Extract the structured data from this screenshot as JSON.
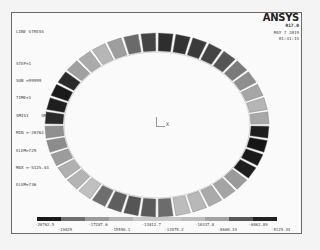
{
  "header": {
    "title": "LINE STRESS",
    "lines": [
      "STEP=1",
      "SUB =99999",
      "TIME=1",
      "SMIS1     SMIS7",
      "MIN =-20762.5",
      "ELEM=729",
      "MAX =-5125.44",
      "ELEM=736"
    ]
  },
  "brand": {
    "logo": "ANSYS",
    "version": "R17.0",
    "date": "MAY  7 2019",
    "time": "01:41:15"
  },
  "triad": {
    "axis_label": "X"
  },
  "legend": {
    "colors": [
      "#1a1a1a",
      "#6e6e6e",
      "#9a9a9a",
      "#b4b4b4",
      "#c8c8c8",
      "#c8c8c8",
      "#bdbdbd",
      "#a2a2a2",
      "#585858",
      "#222222"
    ],
    "labels_top": [
      "-20762.5",
      "-17287.6",
      "-13812.7",
      "-10337.8",
      "-6862.89"
    ],
    "labels_bottom": [
      "-19025",
      "-15550.1",
      "-12075.2",
      "-8600.34",
      "-5125.44"
    ]
  },
  "ring": {
    "center": [
      157,
      125
    ],
    "outer_rx": 112,
    "outer_ry": 92,
    "thickness": 18,
    "segments": 40,
    "shades": [
      "#2e2e2e",
      "#333",
      "#3a3a3a",
      "#444",
      "#555",
      "#7a7a7a",
      "#8e8e8e",
      "#a6a6a6",
      "#b5b5b5",
      "#a8a8a8",
      "#1e1e1e",
      "#161616",
      "#1a1a1a",
      "#1e1e1e",
      "#9a9a9a",
      "#a4a4a4",
      "#aaaaaa",
      "#b8b8b8",
      "#bcbcbc",
      "#6c6c6c",
      "#5a5a5a",
      "#555555",
      "#5e5e5e",
      "#6e6e6e",
      "#c0c0c0",
      "#b4b4b4",
      "#b0b0b0",
      "#9c9c9c",
      "#8c8c8c",
      "#909090",
      "#2a2a2a",
      "#1e1e1e",
      "#1a1a1a",
      "#2a2a2a",
      "#a0a0a0",
      "#ababab",
      "#b6b6b6",
      "#9e9e9e",
      "#6a6a6a",
      "#444444"
    ]
  }
}
